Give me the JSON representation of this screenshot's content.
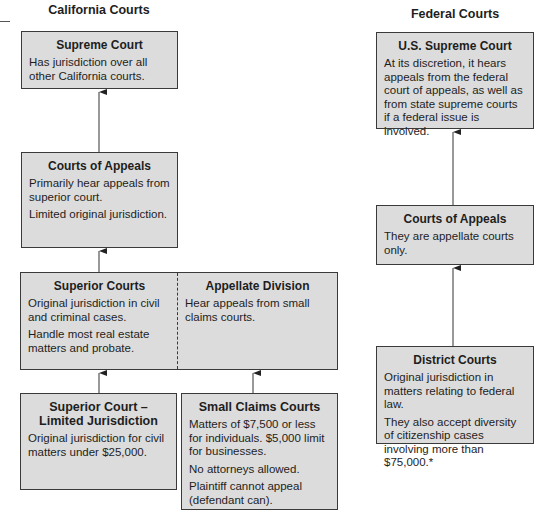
{
  "california": {
    "title": "California Courts",
    "supreme": {
      "heading": "Supreme Court",
      "lines": [
        "Has jurisdiction over all other California courts."
      ]
    },
    "appeals": {
      "heading": "Courts of Appeals",
      "lines": [
        "Primarily hear appeals from superior court.",
        "Limited original jurisdiction."
      ]
    },
    "superior": {
      "heading": "Superior Courts",
      "lines": [
        "Original jurisdiction in civil and criminal cases.",
        "Handle most real estate matters and probate."
      ]
    },
    "appellate_division": {
      "heading": "Appellate Division",
      "lines": [
        "Hear appeals from small claims courts."
      ]
    },
    "limited": {
      "heading": "Superior Court – Limited Jurisdiction",
      "lines": [
        "Original jurisdiction for civil matters under $25,000."
      ]
    },
    "small_claims": {
      "heading": "Small Claims Courts",
      "lines": [
        "Matters of $7,500 or less for individuals. $5,000 limit for businesses.",
        "No attorneys allowed.",
        "Plaintiff cannot appeal (defendant can)."
      ]
    }
  },
  "federal": {
    "title": "Federal Courts",
    "supreme": {
      "heading": "U.S. Supreme Court",
      "lines": [
        "At its discretion, it hears appeals from the federal court of appeals, as well as from state supreme courts if a federal issue is involved."
      ]
    },
    "appeals": {
      "heading": "Courts of Appeals",
      "lines": [
        "They are appellate courts only."
      ]
    },
    "district": {
      "heading": "District Courts",
      "lines": [
        "Original jurisdiction in matters relating to federal law.",
        "They also accept diversity of citizenship cases involving more than $75,000.*"
      ]
    }
  },
  "colors": {
    "box_fill": "#dcdcdc",
    "border": "#3a3a3a",
    "text": "#1e1e1e"
  }
}
